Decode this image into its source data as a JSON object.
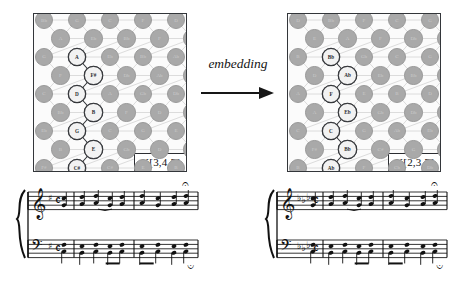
{
  "figure": {
    "background": "#ffffff",
    "node_color": "#a9a9a9",
    "highlight_color": "#f2f2f2",
    "ink_color": "#2b2d31"
  },
  "transform": {
    "label": "embedding",
    "arrow": "right-arrow"
  },
  "panels": [
    {
      "id": "left",
      "k_label": "K[3,4,5]",
      "chain": [
        "A",
        "F#",
        "D",
        "B",
        "G",
        "E",
        "C#"
      ],
      "background_notes": [
        "Bb",
        "G",
        "C",
        "F",
        "D",
        "A",
        "Eb",
        "Bb",
        "F",
        "C",
        "G",
        "Eb",
        "Bb",
        "Ab",
        "F",
        "Db",
        "Ab",
        "E",
        "C",
        "A",
        "Gb",
        "Db",
        "Bb",
        "F",
        "D",
        "Ab",
        "Eb",
        "C",
        "G",
        "E",
        "B",
        "Gb",
        "D",
        "A",
        "F#",
        "C#",
        "E",
        "B",
        "G",
        "D"
      ]
    },
    {
      "id": "right",
      "k_label": "K[2,3,7]",
      "chain": [
        "Bb",
        "Ab",
        "F",
        "Eb",
        "C",
        "Bb",
        "Ab"
      ],
      "background_notes": [
        "D",
        "Bb",
        "F",
        "C",
        "G",
        "E",
        "A",
        "F",
        "Db",
        "Ab",
        "B",
        "Gb",
        "C",
        "G",
        "D",
        "Eb",
        "Bb",
        "F",
        "A",
        "E",
        "B",
        "D",
        "A",
        "Gb",
        "Db",
        "E",
        "C",
        "G",
        "Ab",
        "Eb",
        "F#",
        "C#",
        "G",
        "D",
        "B",
        "F",
        "Cb",
        "Db",
        "A",
        "E"
      ]
    }
  ],
  "scores": [
    {
      "id": "left-score",
      "clefs": [
        "treble",
        "bass"
      ],
      "key_signature": "1 sharp",
      "time_signature": "common time",
      "measures": 3,
      "fermata": true,
      "brace": true
    },
    {
      "id": "right-score",
      "clefs": [
        "treble",
        "bass"
      ],
      "key_signature": "3 flats",
      "time_signature": "common time",
      "measures": 3,
      "fermata": true,
      "brace": true
    }
  ]
}
